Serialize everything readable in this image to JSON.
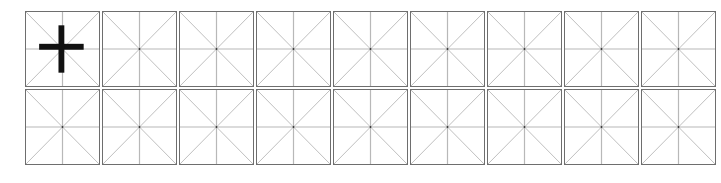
{
  "worksheet": {
    "type": "mi-zi-ge practice grid",
    "rows": 2,
    "columns": 9,
    "colors": {
      "border": "#6e6e6e",
      "guide_line": "#b8b8b8",
      "center_dot": "#333333",
      "stroke": "#111111"
    },
    "cells": [
      {
        "row": 0,
        "col": 0,
        "character": "十"
      }
    ]
  }
}
